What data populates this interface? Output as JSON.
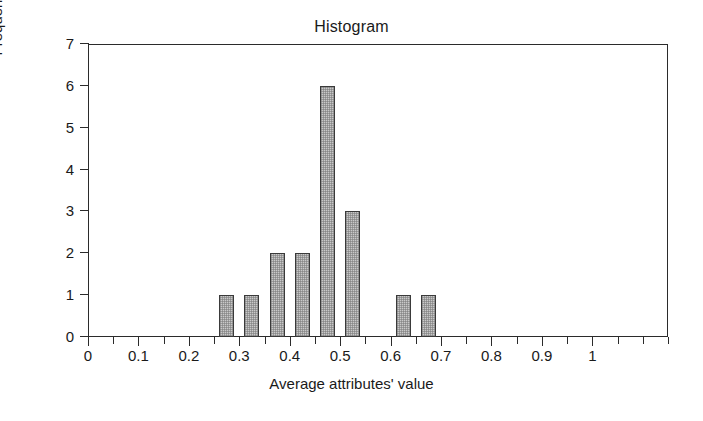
{
  "chart_data": {
    "type": "bar",
    "title": "Histogram",
    "xlabel": "Average attributes' value",
    "ylabel": "Frequency",
    "xlim": [
      0,
      1.15
    ],
    "ylim": [
      0,
      7
    ],
    "grid": false,
    "legend": null,
    "bin_width": 0.05,
    "x_tick_labels": [
      "0",
      "0.1",
      "0.2",
      "0.3",
      "0.4",
      "0.5",
      "0.6",
      "0.7",
      "0.8",
      "0.9",
      "1"
    ],
    "x_tick_values": [
      0,
      0.1,
      0.2,
      0.3,
      0.4,
      0.5,
      0.6,
      0.7,
      0.8,
      0.9,
      1.0
    ],
    "x_minor_tick_step": 0.05,
    "y_tick_labels": [
      "0",
      "1",
      "2",
      "3",
      "4",
      "5",
      "6",
      "7"
    ],
    "y_tick_values": [
      0,
      1,
      2,
      3,
      4,
      5,
      6,
      7
    ],
    "bin_centers": [
      0.275,
      0.325,
      0.375,
      0.425,
      0.475,
      0.525,
      0.625,
      0.675
    ],
    "values": [
      1,
      1,
      2,
      2,
      6,
      3,
      1,
      1
    ],
    "bar_fill_color": "#c9c9c9",
    "bar_edge_color": "#3a3a3a",
    "axis_color": "#2b2b2b",
    "background_color": "#ffffff"
  }
}
